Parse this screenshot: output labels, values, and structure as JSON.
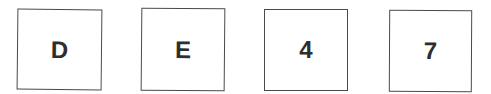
{
  "cards": [
    {
      "label": "D"
    },
    {
      "label": "E"
    },
    {
      "label": "4"
    },
    {
      "label": "7"
    }
  ],
  "colors": {
    "border": "#4a4a4a",
    "text": "#2e2e2e",
    "background": "#ffffff"
  }
}
